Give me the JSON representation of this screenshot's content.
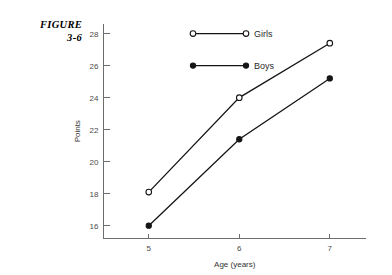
{
  "figure": {
    "label_line1": "FIGURE",
    "label_line2": "3-6"
  },
  "chart_data": {
    "type": "line",
    "title": "",
    "xlabel": "Age (years)",
    "ylabel": "Points",
    "x": [
      5,
      6,
      7
    ],
    "xtick_labels": [
      "5",
      "6",
      "7"
    ],
    "ytick_labels": [
      "16",
      "18",
      "20",
      "22",
      "24",
      "26",
      "28"
    ],
    "yticks": [
      16,
      18,
      20,
      22,
      24,
      26,
      28
    ],
    "ylim": [
      15.2,
      28.6
    ],
    "xlim": [
      4.5,
      7.4
    ],
    "grid": false,
    "legend_position": "upper-center-inside",
    "series": [
      {
        "name": "Girls",
        "marker": "open-circle",
        "color": "#151515",
        "values": [
          18.1,
          24.0,
          27.4
        ]
      },
      {
        "name": "Boys",
        "marker": "filled-circle",
        "color": "#151515",
        "values": [
          16.0,
          21.4,
          25.2
        ]
      }
    ]
  }
}
